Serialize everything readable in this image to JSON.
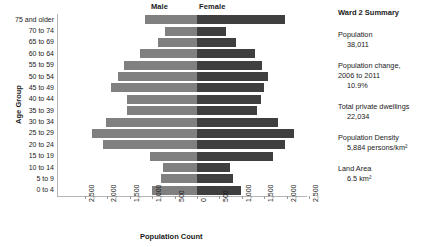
{
  "chart_data": {
    "type": "bar",
    "subtype": "population-pyramid",
    "title": "",
    "xlabel": "Population Count",
    "ylabel": "Age Group",
    "grid": false,
    "legend_position": "top-center",
    "xlim": [
      -2500,
      2500
    ],
    "xticks": [
      -2500,
      -2000,
      -1500,
      -1000,
      -500,
      0,
      500,
      1000,
      1500,
      2000,
      2500
    ],
    "xticklabels": [
      "2,500",
      "2,000",
      "1,500",
      "1,000",
      "500",
      "0",
      "500",
      "1,000",
      "1,500",
      "2,000",
      "2,500"
    ],
    "categories": [
      "75 and older",
      "70 to 74",
      "65 to 69",
      "60 to 64",
      "55 to 59",
      "50 to 54",
      "45 to 49",
      "40 to 44",
      "35 to 39",
      "30 to 34",
      "25 to 29",
      "20 to 24",
      "15 to 19",
      "10 to 14",
      "5 to 9",
      "0 to 4"
    ],
    "series": [
      {
        "name": "Male",
        "color": "#808080",
        "direction": "left",
        "values": [
          1150,
          720,
          860,
          1270,
          1630,
          1760,
          1930,
          1560,
          1570,
          2040,
          2340,
          2100,
          1055,
          760,
          805,
          1005
        ]
      },
      {
        "name": "Female",
        "color": "#3f3f3f",
        "direction": "right",
        "values": [
          1970,
          640,
          880,
          1300,
          1440,
          1580,
          1490,
          1430,
          1345,
          1810,
          2160,
          1960,
          1700,
          730,
          805,
          990
        ]
      }
    ]
  },
  "legend": {
    "male": "Male",
    "female": "Female"
  },
  "axes": {
    "x_title": "Population Count",
    "y_title": "Age Group"
  },
  "summary": {
    "title": "Ward 2 Summary",
    "stats": [
      {
        "label": "Population",
        "value": "38,011"
      },
      {
        "label": "Population change,",
        "label2": "2006 to 2011",
        "value": "10.9%"
      },
      {
        "label": "Total private dwellings",
        "value": "22,034"
      },
      {
        "label": "Population Density",
        "value": "5,884 persons/km²"
      },
      {
        "label": "Land Area",
        "value": "6.5 km²"
      }
    ]
  }
}
